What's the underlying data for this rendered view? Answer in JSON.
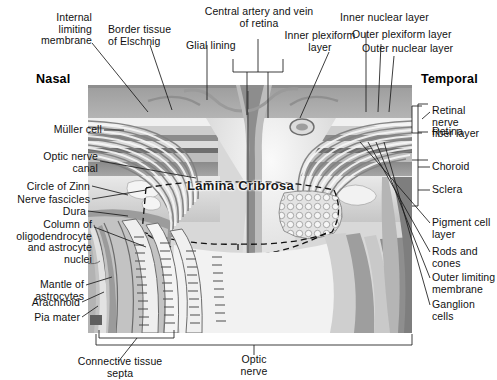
{
  "figure": {
    "orientation_left": "Nasal",
    "orientation_right": "Temporal",
    "center_label": "Lamina Cribrosa",
    "colors": {
      "ink": "#1b1b1b",
      "page": "#ffffff",
      "tissue_mid": "#a9a9a9",
      "tissue_dark": "#6f6f6f",
      "tissue_light": "#e6e6e6",
      "sclera": "#cfcfcf",
      "choroid": "#8f8f8f"
    }
  },
  "labels": {
    "top_left": [
      {
        "id": "internal-limiting-membrane",
        "text": "Internal\nlimiting\nmembrane"
      },
      {
        "id": "border-tissue-of-elschnig",
        "text": "Border tissue\nof Elschnig"
      },
      {
        "id": "glial-lining",
        "text": "Glial lining"
      }
    ],
    "top_center": [
      {
        "id": "central-artery-and-vein-of-retina",
        "text": "Central artery and vein\nof retina"
      }
    ],
    "top_right": [
      {
        "id": "inner-plexiform-layer",
        "text": "Inner plexiform\nlayer"
      },
      {
        "id": "inner-nuclear-layer",
        "text": "Inner nuclear layer"
      },
      {
        "id": "outer-plexiform-layer",
        "text": "Outer plexiform layer"
      },
      {
        "id": "outer-nuclear-layer",
        "text": "Outer nuclear layer"
      }
    ],
    "left": [
      {
        "id": "muller-cell",
        "text": "Müller cell"
      },
      {
        "id": "optic-nerve-canal",
        "text": "Optic nerve\ncanal"
      },
      {
        "id": "circle-of-zinn",
        "text": "Circle of Zinn"
      },
      {
        "id": "nerve-fascicles",
        "text": "Nerve fascicles"
      },
      {
        "id": "dura",
        "text": "Dura"
      },
      {
        "id": "column-of-oligodendrocyte-and-astrocyte-nuclei",
        "text": "Column of\noligodendrocyte\nand astrocyte\nnuclei"
      },
      {
        "id": "mantle-of-astrocytes",
        "text": "Mantle of\nastrocytes"
      },
      {
        "id": "arachnoid",
        "text": "Arachnoid"
      },
      {
        "id": "pia-mater",
        "text": "Pia mater"
      }
    ],
    "right": [
      {
        "id": "retinal-nerve-fiber-layer",
        "text": "Retinal\nnerve\nfiber layer"
      },
      {
        "id": "retina",
        "text": "Retina"
      },
      {
        "id": "choroid",
        "text": "Choroid"
      },
      {
        "id": "sclera",
        "text": "Sclera"
      },
      {
        "id": "pigment-cell-layer",
        "text": "Pigment cell\nlayer"
      },
      {
        "id": "rods-and-cones",
        "text": "Rods and\ncones"
      },
      {
        "id": "outer-limiting-membrane",
        "text": "Outer limiting\nmembrane"
      },
      {
        "id": "ganglion-cells",
        "text": "Ganglion\ncells"
      }
    ],
    "bottom": [
      {
        "id": "connective-tissue-septa",
        "text": "Connective tissue\nsepta"
      },
      {
        "id": "optic-nerve",
        "text": "Optic\nnerve"
      }
    ]
  }
}
